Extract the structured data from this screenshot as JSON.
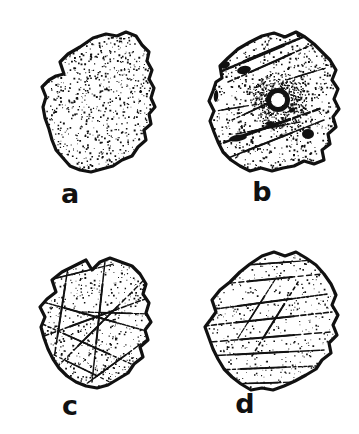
{
  "figure": {
    "type": "scientific-illustration-plate",
    "medium": "pen-and-ink stipple line drawing",
    "background_color": "#ffffff",
    "ink_color": "#111111",
    "width": 359,
    "height": 434,
    "columns": 2,
    "rows": 2
  },
  "panels": [
    {
      "id": "a",
      "label": "a",
      "label_x": 70,
      "label_y": 180,
      "origin_x": 18,
      "origin_y": 14,
      "width": 150,
      "height": 170,
      "texture": "uniform dense stipple, smooth featureless surface",
      "outline_weight": 3.2,
      "stipple_count": 1500,
      "stipple_size": 1.15,
      "stipple_seed": 1207,
      "has_lines": false,
      "has_blobs": false,
      "has_vesicle": false,
      "outline": "M 46,60 L 42,48 L 50,40 L 62,33 L 75,24 L 88,20 L 99,22 L 108,18 L 118,22 L 124,31 L 131,38 L 129,47 L 134,56 L 131,65 L 136,74 L 133,84 L 137,93 L 131,100 L 133,110 L 126,116 L 128,126 L 120,133 L 114,142 L 104,146 L 95,152 L 84,155 L 73,158 L 62,156 L 52,152 L 45,144 L 38,136 L 34,126 L 31,115 L 27,104 L 25,93 L 28,83 L 24,73 L 31,66 L 38,62 Z"
    },
    {
      "id": "b",
      "label": "b",
      "label_x": 262,
      "label_y": 178,
      "origin_x": 192,
      "origin_y": 16,
      "width": 158,
      "height": 168,
      "texture": "mottled stipple with dark inclusions, long fracture streaks and a central vesicle",
      "outline_weight": 3.2,
      "stipple_count": 1250,
      "stipple_size": 1.25,
      "stipple_seed": 4413,
      "has_lines": true,
      "has_blobs": true,
      "has_vesicle": true,
      "vesicle": {
        "cx": 86,
        "cy": 84,
        "r_outer": 12,
        "r_inner": 7
      },
      "streaks": [
        {
          "x1": 30,
          "y1": 55,
          "x2": 118,
          "y2": 18,
          "w": 2.6
        },
        {
          "x1": 36,
          "y1": 66,
          "x2": 126,
          "y2": 26,
          "w": 1.6
        },
        {
          "x1": 22,
          "y1": 130,
          "x2": 130,
          "y2": 92,
          "w": 2.4
        },
        {
          "x1": 26,
          "y1": 146,
          "x2": 132,
          "y2": 104,
          "w": 1.6
        },
        {
          "x1": 40,
          "y1": 104,
          "x2": 92,
          "y2": 80,
          "w": 1.4
        },
        {
          "x1": 18,
          "y1": 96,
          "x2": 66,
          "y2": 88,
          "w": 1.2
        },
        {
          "x1": 94,
          "y1": 64,
          "x2": 134,
          "y2": 52,
          "w": 1.2
        },
        {
          "x1": 44,
          "y1": 118,
          "x2": 108,
          "y2": 106,
          "w": 1.3
        }
      ],
      "blobs": [
        {
          "cx": 33,
          "cy": 49,
          "rx": 5,
          "ry": 3.5,
          "rot": -20
        },
        {
          "cx": 52,
          "cy": 54,
          "rx": 7,
          "ry": 4,
          "rot": -12
        },
        {
          "cx": 24,
          "cy": 80,
          "rx": 2.2,
          "ry": 6,
          "rot": 4
        },
        {
          "cx": 46,
          "cy": 122,
          "rx": 9,
          "ry": 3.2,
          "rot": -8
        },
        {
          "cx": 116,
          "cy": 118,
          "rx": 6,
          "ry": 5,
          "rot": 0
        },
        {
          "cx": 78,
          "cy": 108,
          "rx": 4,
          "ry": 2.6,
          "rot": 14
        },
        {
          "cx": 100,
          "cy": 94,
          "rx": 3.4,
          "ry": 2.4,
          "rot": -30
        }
      ],
      "outline": "M 30,62 L 28,50 L 36,42 L 46,33 L 58,26 L 70,20 L 82,17 L 93,21 L 104,16 L 113,21 L 122,28 L 130,36 L 138,44 L 144,54 L 140,64 L 146,73 L 142,83 L 147,93 L 141,101 L 144,111 L 136,118 L 138,128 L 130,134 L 132,144 L 122,148 L 112,145 L 102,150 L 91,152 L 80,155 L 69,152 L 58,155 L 48,150 L 39,144 L 31,136 L 26,126 L 22,116 L 18,105 L 22,95 L 17,85 L 21,75 L 24,66 Z"
    },
    {
      "id": "c",
      "label": "c",
      "label_x": 70,
      "label_y": 392,
      "origin_x": 22,
      "origin_y": 240,
      "width": 146,
      "height": 160,
      "texture": "stippled surface divided by an intersecting network of conchoidal fracture lines into polygonal domains",
      "outline_weight": 3.2,
      "stipple_count": 1100,
      "stipple_size": 1.1,
      "stipple_seed": 8821,
      "has_lines": true,
      "has_blobs": false,
      "has_vesicle": false,
      "streaks": [
        {
          "x1": 14,
          "y1": 60,
          "x2": 128,
          "y2": 92,
          "w": 1.5
        },
        {
          "x1": 22,
          "y1": 96,
          "x2": 126,
          "y2": 58,
          "w": 1.5
        },
        {
          "x1": 48,
          "y1": 14,
          "x2": 30,
          "y2": 132,
          "w": 1.5
        },
        {
          "x1": 84,
          "y1": 12,
          "x2": 70,
          "y2": 142,
          "w": 1.5
        },
        {
          "x1": 16,
          "y1": 82,
          "x2": 118,
          "y2": 128,
          "w": 1.4
        },
        {
          "x1": 34,
          "y1": 128,
          "x2": 122,
          "y2": 40,
          "w": 1.4
        },
        {
          "x1": 10,
          "y1": 44,
          "x2": 92,
          "y2": 24,
          "w": 1.3
        },
        {
          "x1": 56,
          "y1": 150,
          "x2": 124,
          "y2": 100,
          "w": 1.3
        },
        {
          "x1": 26,
          "y1": 112,
          "x2": 96,
          "y2": 146,
          "w": 1.2
        },
        {
          "x1": 60,
          "y1": 72,
          "x2": 130,
          "y2": 74,
          "w": 1.2
        }
      ],
      "outline": "M 34,52 L 30,40 L 40,32 L 52,26 L 64,20 L 70,30 L 78,22 L 88,18 L 99,22 L 110,26 L 118,34 L 124,44 L 121,54 L 127,63 L 124,73 L 129,82 L 123,90 L 126,100 L 118,107 L 121,117 L 112,124 L 106,133 L 96,139 L 86,145 L 75,148 L 64,146 L 54,142 L 45,136 L 37,128 L 31,119 L 26,109 L 22,98 L 19,87 L 23,77 L 18,67 L 25,59 Z"
    },
    {
      "id": "d",
      "label": "d",
      "label_x": 245,
      "label_y": 390,
      "origin_x": 190,
      "origin_y": 238,
      "width": 160,
      "height": 162,
      "texture": "sparse stipple with long sub-parallel horizontal striations sweeping across the grain",
      "outline_weight": 3.2,
      "stipple_count": 820,
      "stipple_size": 1.05,
      "stipple_seed": 3359,
      "has_lines": true,
      "has_blobs": false,
      "has_vesicle": false,
      "streaks": [
        {
          "x1": 18,
          "y1": 72,
          "x2": 138,
          "y2": 56,
          "w": 1.6
        },
        {
          "x1": 14,
          "y1": 88,
          "x2": 142,
          "y2": 74,
          "w": 1.6
        },
        {
          "x1": 20,
          "y1": 104,
          "x2": 140,
          "y2": 94,
          "w": 1.5
        },
        {
          "x1": 16,
          "y1": 118,
          "x2": 134,
          "y2": 112,
          "w": 1.5
        },
        {
          "x1": 26,
          "y1": 132,
          "x2": 126,
          "y2": 128,
          "w": 1.4
        },
        {
          "x1": 32,
          "y1": 46,
          "x2": 132,
          "y2": 36,
          "w": 1.4
        },
        {
          "x1": 44,
          "y1": 28,
          "x2": 124,
          "y2": 22,
          "w": 1.3
        },
        {
          "x1": 36,
          "y1": 146,
          "x2": 110,
          "y2": 144,
          "w": 1.3
        },
        {
          "x1": 62,
          "y1": 118,
          "x2": 108,
          "y2": 44,
          "w": 1.6
        },
        {
          "x1": 48,
          "y1": 100,
          "x2": 86,
          "y2": 40,
          "w": 1.2
        }
      ],
      "outline": "M 26,74 L 22,62 L 30,52 L 40,44 L 50,34 L 60,26 L 72,18 L 84,14 L 95,18 L 106,14 L 116,20 L 126,27 L 134,36 L 141,46 L 146,57 L 142,67 L 148,77 L 143,87 L 147,97 L 139,105 L 141,115 L 132,122 L 126,131 L 116,137 L 105,143 L 94,148 L 83,152 L 72,150 L 61,152 L 51,146 L 42,139 L 34,131 L 28,121 L 23,111 L 19,100 L 15,89 L 21,81 Z"
    }
  ]
}
